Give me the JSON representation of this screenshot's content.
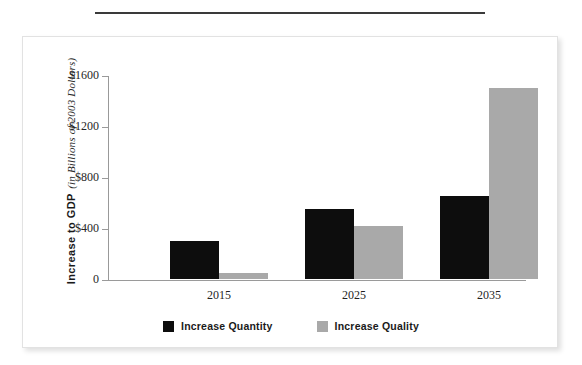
{
  "chart_data": {
    "type": "bar",
    "title": "",
    "xlabel": "",
    "ylabel": "Increase to GDP (in Billions of 2003 Dollars)",
    "ylabel_main": "Increase to GDP",
    "ylabel_sub": "(in Billions of 2003 Dollars)",
    "categories": [
      "2015",
      "2025",
      "2035"
    ],
    "series": [
      {
        "name": "Increase Quantity",
        "color": "#0d0d0d",
        "values": [
          300,
          550,
          650
        ]
      },
      {
        "name": "Increase Quality",
        "color": "#a9a9a9",
        "values": [
          50,
          415,
          1500
        ]
      }
    ],
    "ylim": [
      0,
      1600
    ],
    "yticks": [
      0,
      400,
      800,
      1200,
      1600
    ],
    "ytick_labels": [
      "0",
      "$400",
      "$800",
      "$1200",
      "$1600"
    ],
    "grid": false,
    "legend_position": "bottom"
  },
  "legend": {
    "items": [
      {
        "label": "Increase Quantity",
        "swatch": "quantity"
      },
      {
        "label": "Increase Quality",
        "swatch": "quality"
      }
    ]
  }
}
